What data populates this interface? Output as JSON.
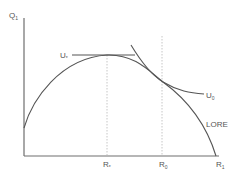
{
  "diagram": {
    "type": "economic-indifference-curve",
    "axes": {
      "y_label": "Q",
      "y_label_sub": "1",
      "x_label": "R",
      "x_label_sub": "1"
    },
    "curves": {
      "frontier_label": "LORE",
      "u_star_label": "U",
      "u_star_sub": "*",
      "u_zero_label": "U",
      "u_zero_sub": "0"
    },
    "ticks": {
      "r_star_label": "R",
      "r_star_sub": "*",
      "r_zero_label": "R",
      "r_zero_sub": "0"
    },
    "colors": {
      "line": "#555555",
      "axis": "#6e6e6e",
      "guide": "#b8b8b8",
      "background": "#ffffff"
    }
  }
}
